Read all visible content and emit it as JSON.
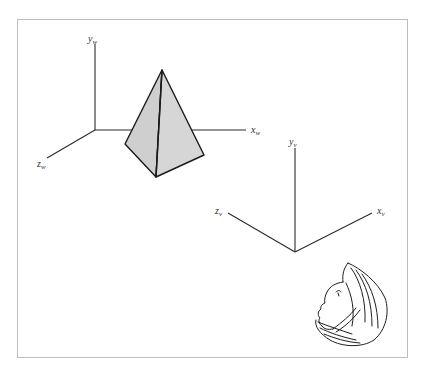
{
  "figure": {
    "type": "3d-viewing-coordinate-diagram",
    "world_axes": {
      "name": "world-coordinate-system",
      "labels": {
        "y": {
          "main": "y",
          "sub": "w"
        },
        "x": {
          "main": "x",
          "sub": "w"
        },
        "z": {
          "main": "z",
          "sub": "w"
        }
      }
    },
    "viewing_axes": {
      "name": "viewing-coordinate-system",
      "labels": {
        "y": {
          "main": "y",
          "sub": "v"
        },
        "x": {
          "main": "x",
          "sub": "v"
        },
        "z": {
          "main": "z",
          "sub": "v"
        }
      }
    },
    "object": {
      "shape": "pyramid",
      "fill_color": "#cfcfcf",
      "edge_color": "#1a1a1a"
    },
    "viewer": {
      "shape": "head-profile-sketch",
      "facing": "up-left"
    },
    "frame_color": "#bdbdbd",
    "axis_color": "#2a2a2a"
  }
}
